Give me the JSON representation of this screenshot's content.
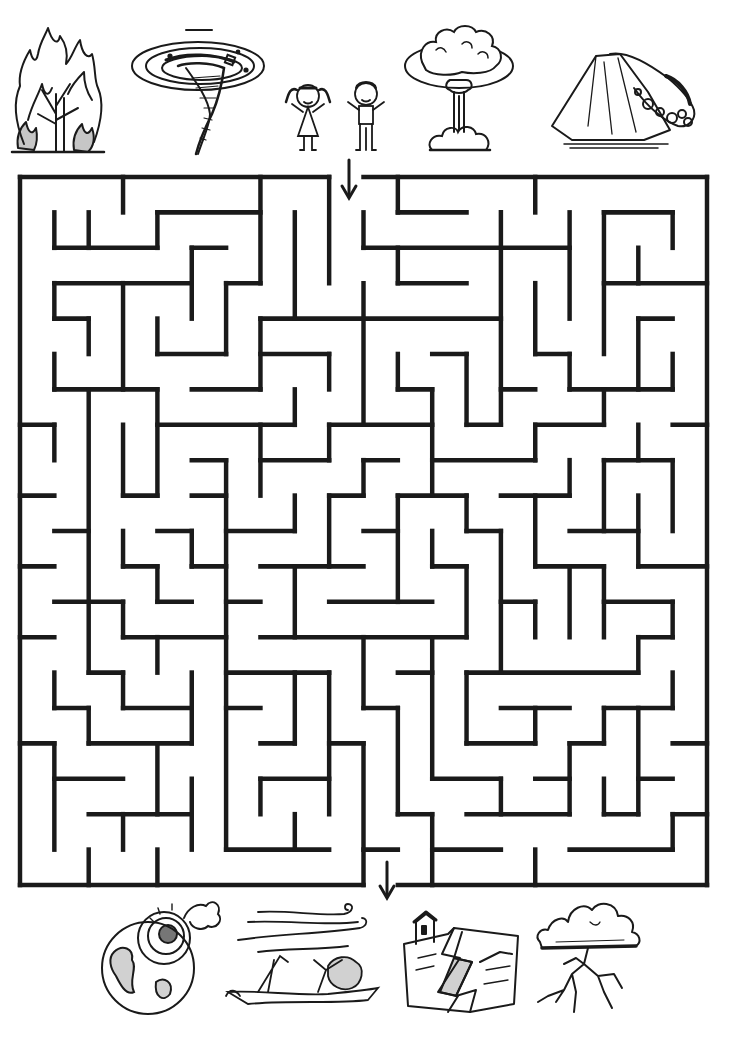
{
  "puzzle": {
    "type": "maze",
    "title": "Natural disasters maze",
    "grid": {
      "cols": 20,
      "rows": 20
    },
    "wall_color": "#1a1a1a",
    "entrance": {
      "side": "top",
      "col": 9,
      "label": "Start"
    },
    "exit": {
      "side": "bottom",
      "col": 10,
      "label": "Finish"
    },
    "walls": {
      "h": [
        [
          0,
          0,
          9
        ],
        [
          0,
          10,
          20
        ],
        [
          1,
          4,
          7
        ],
        [
          1,
          11,
          13
        ],
        [
          1,
          17,
          19
        ],
        [
          2,
          1,
          4
        ],
        [
          2,
          5,
          6
        ],
        [
          2,
          10,
          16
        ],
        [
          3,
          1,
          5
        ],
        [
          3,
          6,
          7
        ],
        [
          3,
          11,
          13
        ],
        [
          3,
          17,
          20
        ],
        [
          4,
          1,
          2
        ],
        [
          4,
          7,
          14
        ],
        [
          4,
          18,
          19
        ],
        [
          5,
          4,
          6
        ],
        [
          5,
          7,
          9
        ],
        [
          5,
          12,
          13
        ],
        [
          5,
          15,
          16
        ],
        [
          6,
          1,
          4
        ],
        [
          6,
          5,
          7
        ],
        [
          6,
          11,
          12
        ],
        [
          6,
          14,
          15
        ],
        [
          6,
          16,
          19
        ],
        [
          7,
          0,
          1
        ],
        [
          7,
          4,
          8
        ],
        [
          7,
          9,
          12
        ],
        [
          7,
          13,
          14
        ],
        [
          7,
          15,
          17
        ],
        [
          7,
          19,
          20
        ],
        [
          8,
          5,
          6
        ],
        [
          8,
          7,
          9
        ],
        [
          8,
          10,
          11
        ],
        [
          8,
          12,
          15
        ],
        [
          8,
          17,
          19
        ],
        [
          9,
          0,
          1
        ],
        [
          9,
          3,
          4
        ],
        [
          9,
          5,
          6
        ],
        [
          9,
          9,
          10
        ],
        [
          9,
          11,
          13
        ],
        [
          9,
          14,
          16
        ],
        [
          10,
          1,
          2
        ],
        [
          10,
          4,
          5
        ],
        [
          10,
          6,
          8
        ],
        [
          10,
          10,
          11
        ],
        [
          10,
          13,
          14
        ],
        [
          10,
          16,
          18
        ],
        [
          11,
          0,
          1
        ],
        [
          11,
          3,
          4
        ],
        [
          11,
          5,
          6
        ],
        [
          11,
          7,
          10
        ],
        [
          11,
          12,
          13
        ],
        [
          11,
          15,
          17
        ],
        [
          11,
          18,
          20
        ],
        [
          12,
          1,
          3
        ],
        [
          12,
          4,
          5
        ],
        [
          12,
          6,
          7
        ],
        [
          12,
          9,
          12
        ],
        [
          12,
          14,
          15
        ],
        [
          12,
          17,
          19
        ],
        [
          13,
          0,
          1
        ],
        [
          13,
          3,
          6
        ],
        [
          13,
          7,
          13
        ],
        [
          13,
          18,
          19
        ],
        [
          14,
          2,
          3
        ],
        [
          14,
          6,
          9
        ],
        [
          14,
          11,
          12
        ],
        [
          14,
          13,
          18
        ],
        [
          15,
          1,
          2
        ],
        [
          15,
          3,
          5
        ],
        [
          15,
          6,
          7
        ],
        [
          15,
          10,
          11
        ],
        [
          15,
          14,
          16
        ],
        [
          15,
          17,
          19
        ],
        [
          16,
          0,
          1
        ],
        [
          16,
          2,
          5
        ],
        [
          16,
          7,
          8
        ],
        [
          16,
          9,
          10
        ],
        [
          16,
          13,
          15
        ],
        [
          16,
          16,
          17
        ],
        [
          16,
          19,
          20
        ],
        [
          17,
          1,
          3
        ],
        [
          17,
          7,
          9
        ],
        [
          17,
          12,
          14
        ],
        [
          17,
          15,
          16
        ],
        [
          17,
          18,
          19
        ],
        [
          18,
          2,
          5
        ],
        [
          18,
          11,
          12
        ],
        [
          18,
          13,
          16
        ],
        [
          18,
          17,
          18
        ],
        [
          18,
          19,
          20
        ],
        [
          19,
          6,
          9
        ],
        [
          19,
          10,
          11
        ],
        [
          19,
          12,
          14
        ],
        [
          19,
          16,
          19
        ],
        [
          20,
          0,
          10
        ],
        [
          20,
          11,
          20
        ]
      ],
      "v": [
        [
          0,
          0,
          20
        ],
        [
          1,
          1,
          2
        ],
        [
          1,
          3,
          4
        ],
        [
          1,
          5,
          6
        ],
        [
          1,
          7,
          8
        ],
        [
          1,
          14,
          15
        ],
        [
          1,
          16,
          19
        ],
        [
          2,
          1,
          2
        ],
        [
          2,
          4,
          5
        ],
        [
          2,
          6,
          14
        ],
        [
          2,
          15,
          16
        ],
        [
          2,
          19,
          20
        ],
        [
          3,
          0,
          1
        ],
        [
          3,
          3,
          6
        ],
        [
          3,
          7,
          9
        ],
        [
          3,
          10,
          11
        ],
        [
          3,
          12,
          13
        ],
        [
          3,
          14,
          15
        ],
        [
          3,
          18,
          19
        ],
        [
          4,
          1,
          2
        ],
        [
          4,
          4,
          5
        ],
        [
          4,
          6,
          9
        ],
        [
          4,
          11,
          12
        ],
        [
          4,
          13,
          14
        ],
        [
          4,
          16,
          18
        ],
        [
          4,
          19,
          20
        ],
        [
          5,
          2,
          4
        ],
        [
          5,
          10,
          11
        ],
        [
          5,
          14,
          16
        ],
        [
          5,
          17,
          19
        ],
        [
          6,
          3,
          5
        ],
        [
          6,
          8,
          19
        ],
        [
          7,
          0,
          3
        ],
        [
          7,
          4,
          6
        ],
        [
          7,
          7,
          9
        ],
        [
          7,
          17,
          18
        ],
        [
          8,
          1,
          4
        ],
        [
          8,
          6,
          7
        ],
        [
          8,
          9,
          10
        ],
        [
          8,
          11,
          13
        ],
        [
          8,
          14,
          16
        ],
        [
          8,
          18,
          19
        ],
        [
          9,
          0,
          3
        ],
        [
          9,
          5,
          6
        ],
        [
          9,
          7,
          8
        ],
        [
          9,
          9,
          11
        ],
        [
          9,
          14,
          18
        ],
        [
          10,
          1,
          2
        ],
        [
          10,
          3,
          7
        ],
        [
          10,
          8,
          9
        ],
        [
          10,
          13,
          15
        ],
        [
          10,
          16,
          20
        ],
        [
          11,
          0,
          1
        ],
        [
          11,
          2,
          3
        ],
        [
          11,
          5,
          6
        ],
        [
          11,
          9,
          12
        ],
        [
          11,
          15,
          18
        ],
        [
          12,
          6,
          9
        ],
        [
          12,
          10,
          11
        ],
        [
          12,
          13,
          17
        ],
        [
          12,
          18,
          20
        ],
        [
          13,
          5,
          7
        ],
        [
          13,
          9,
          10
        ],
        [
          13,
          11,
          13
        ],
        [
          13,
          14,
          16
        ],
        [
          14,
          1,
          7
        ],
        [
          14,
          10,
          14
        ],
        [
          14,
          17,
          18
        ],
        [
          15,
          0,
          1
        ],
        [
          15,
          3,
          5
        ],
        [
          15,
          7,
          8
        ],
        [
          15,
          9,
          11
        ],
        [
          15,
          12,
          13
        ],
        [
          15,
          15,
          16
        ],
        [
          15,
          19,
          20
        ],
        [
          16,
          1,
          4
        ],
        [
          16,
          5,
          6
        ],
        [
          16,
          8,
          9
        ],
        [
          16,
          11,
          13
        ],
        [
          16,
          16,
          18
        ],
        [
          17,
          1,
          5
        ],
        [
          17,
          6,
          7
        ],
        [
          17,
          8,
          10
        ],
        [
          17,
          11,
          13
        ],
        [
          17,
          15,
          16
        ],
        [
          17,
          17,
          18
        ],
        [
          18,
          2,
          3
        ],
        [
          18,
          4,
          6
        ],
        [
          18,
          7,
          8
        ],
        [
          18,
          9,
          11
        ],
        [
          18,
          13,
          14
        ],
        [
          18,
          15,
          18
        ],
        [
          19,
          1,
          2
        ],
        [
          19,
          5,
          6
        ],
        [
          19,
          8,
          10
        ],
        [
          19,
          12,
          13
        ],
        [
          19,
          14,
          15
        ],
        [
          19,
          18,
          19
        ],
        [
          20,
          0,
          20
        ]
      ]
    }
  },
  "top_pictures": [
    {
      "name": "wildfire",
      "label": "Burning tree (wildfire)"
    },
    {
      "name": "tornado",
      "label": "Tornado"
    },
    {
      "name": "children",
      "label": "Girl and boy (start)"
    },
    {
      "name": "nuclear-explosion",
      "label": "Mushroom cloud explosion"
    },
    {
      "name": "landslide",
      "label": "Landslide / volcano"
    }
  ],
  "bottom_pictures": [
    {
      "name": "meteor",
      "label": "Meteor hitting Earth"
    },
    {
      "name": "hurricane",
      "label": "Hurricane wind breaking trees"
    },
    {
      "name": "earthquake",
      "label": "Earthquake cracked ground with house"
    },
    {
      "name": "thunderstorm",
      "label": "Storm cloud with lightning"
    }
  ],
  "arrows": {
    "start_icon": "arrow-down-icon",
    "finish_icon": "arrow-down-icon"
  }
}
